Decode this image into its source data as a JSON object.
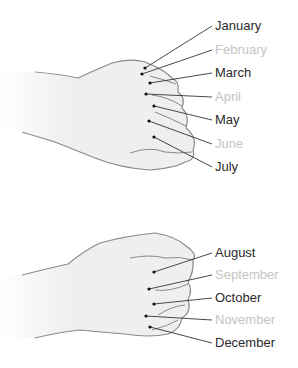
{
  "diagram": {
    "colors": {
      "long_month": "#2b2b2b",
      "short_month": "#c4c4c4",
      "hand_fill": "#efefef",
      "hand_outline": "#8a8a8a"
    },
    "top_fist": {
      "months": [
        {
          "label": "January",
          "type": "long",
          "dot": [
            145,
            68
          ],
          "label_pos": [
            215,
            26
          ]
        },
        {
          "label": "February",
          "type": "short",
          "dot": [
            142,
            74
          ],
          "label_pos": [
            215,
            50
          ]
        },
        {
          "label": "March",
          "type": "long",
          "dot": [
            150,
            83
          ],
          "label_pos": [
            215,
            73
          ]
        },
        {
          "label": "April",
          "type": "short",
          "dot": [
            146,
            94
          ],
          "label_pos": [
            215,
            97
          ]
        },
        {
          "label": "May",
          "type": "long",
          "dot": [
            154,
            106
          ],
          "label_pos": [
            215,
            120
          ]
        },
        {
          "label": "June",
          "type": "short",
          "dot": [
            149,
            121
          ],
          "label_pos": [
            215,
            144
          ]
        },
        {
          "label": "July",
          "type": "long",
          "dot": [
            154,
            137
          ],
          "label_pos": [
            215,
            167
          ]
        }
      ]
    },
    "bottom_fist": {
      "months": [
        {
          "label": "August",
          "type": "long",
          "dot": [
            154,
            272
          ],
          "label_pos": [
            215,
            253
          ]
        },
        {
          "label": "September",
          "type": "short",
          "dot": [
            149,
            289
          ],
          "label_pos": [
            215,
            275
          ]
        },
        {
          "label": "October",
          "type": "long",
          "dot": [
            154,
            304
          ],
          "label_pos": [
            215,
            298
          ]
        },
        {
          "label": "November",
          "type": "short",
          "dot": [
            146,
            316
          ],
          "label_pos": [
            215,
            320
          ]
        },
        {
          "label": "December",
          "type": "long",
          "dot": [
            150,
            327
          ],
          "label_pos": [
            215,
            343
          ]
        }
      ]
    }
  }
}
